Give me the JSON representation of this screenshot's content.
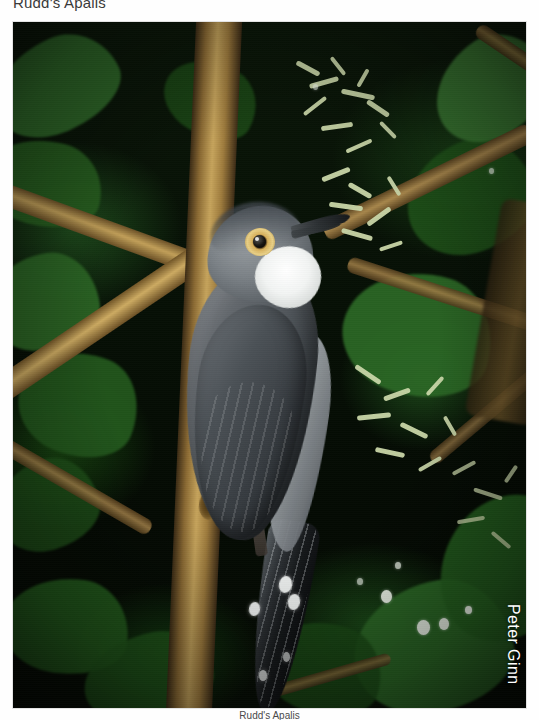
{
  "page": {
    "kind": "field-guide-photo-page",
    "background_color": "#fefefe"
  },
  "heading": {
    "text": "Rudd's Apalis",
    "color": "#3a3a3a",
    "note": "top of glyphs clipped by page edge"
  },
  "photo": {
    "subject": "Rudd's Apalis perched on a lichen-covered branch",
    "alt": "Grey bird with white throat, amber eye-ring and white-tipped dark tail on a branch in dark green foliage",
    "credit": "Peter Ginn",
    "credit_orientation": "vertical",
    "credit_color": "#ffffff",
    "frame": {
      "left": 13,
      "top": 22,
      "width": 513,
      "height": 686
    },
    "palette": {
      "background_dark": "#060f05",
      "foliage_green": "#2a6624",
      "branch_tan": "#c6a45c",
      "lichen_pale": "#c9d6a8",
      "bird_grey": "#60656a",
      "bird_dark": "#2c3135",
      "throat_white": "#ffffff",
      "eye_ring_amber": "#d8b15c",
      "tail_tip_white": "#f4f7f6"
    }
  },
  "caption": {
    "text": "Rudd's Apalis",
    "note": "clipped at bottom page edge"
  },
  "icons": {
    "none": ""
  }
}
